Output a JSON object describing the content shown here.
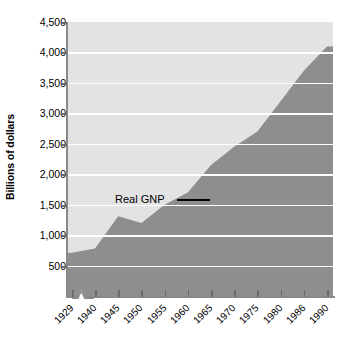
{
  "chart_data": {
    "type": "area",
    "title": "",
    "xlabel": "",
    "ylabel": "Billions of dollars",
    "ylim": [
      0,
      4500
    ],
    "grid": true,
    "legend_position": "inline-annotation",
    "series_label": "Real GNP",
    "y_ticks": [
      "500",
      "1,000",
      "1,500",
      "2,000",
      "2,500",
      "3,000",
      "3,500",
      "4,000",
      "4,500"
    ],
    "y_tick_values": [
      500,
      1000,
      1500,
      2000,
      2500,
      3000,
      3500,
      4000,
      4500
    ],
    "x_ticks": [
      "1929",
      "1940",
      "1945",
      "1950",
      "1955",
      "1960",
      "1965",
      "1970",
      "1975",
      "1980",
      "1986",
      "1990"
    ],
    "categories": [
      1929,
      1940,
      1945,
      1950,
      1955,
      1960,
      1965,
      1970,
      1975,
      1980,
      1986,
      1990
    ],
    "values": [
      710,
      780,
      1310,
      1200,
      1500,
      1700,
      2150,
      2450,
      2700,
      3200,
      3700,
      4100
    ],
    "axis_break_after": "1929",
    "series": [
      {
        "name": "Real GNP",
        "values": [
          710,
          780,
          1310,
          1200,
          1500,
          1700,
          2150,
          2450,
          2700,
          3200,
          3700,
          4100
        ]
      }
    ],
    "colors": {
      "plot_background": "#e3e3e3",
      "gridline": "#ffffff",
      "area_fill": "#8e8e8e",
      "axis": "#8a8a8a",
      "text": "#000000"
    }
  }
}
